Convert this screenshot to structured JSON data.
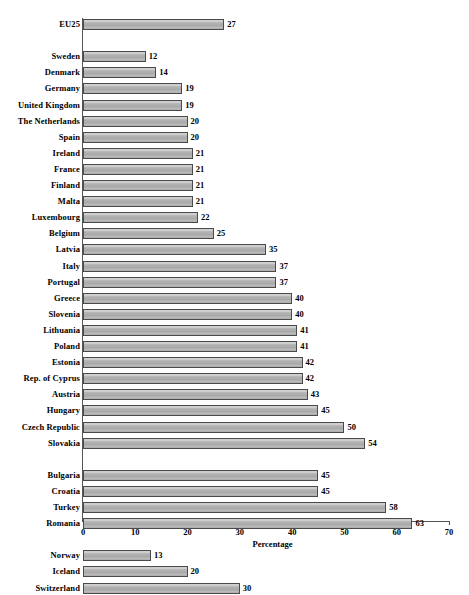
{
  "chart_data": {
    "type": "bar",
    "orientation": "horizontal",
    "title": "",
    "xlabel": "Percentage",
    "ylabel": "",
    "xlim": [
      0,
      70
    ],
    "xticks": [
      0,
      10,
      20,
      30,
      40,
      50,
      60,
      70
    ],
    "grid": false,
    "legend": null,
    "bar_value_labels": true,
    "groups": [
      {
        "name": "aggregate",
        "categories": [
          "EU25"
        ],
        "values": [
          27
        ]
      },
      {
        "name": "eu-member-states",
        "categories": [
          "Sweden",
          "Denmark",
          "Germany",
          "United Kingdom",
          "The Netherlands",
          "Spain",
          "Ireland",
          "France",
          "Finland",
          "Malta",
          "Luxembourg",
          "Belgium",
          "Latvia",
          "Italy",
          "Portugal",
          "Greece",
          "Slovenia",
          "Lithuania",
          "Poland",
          "Estonia",
          "Rep. of Cyprus",
          "Austria",
          "Hungary",
          "Czech Republic",
          "Slovakia"
        ],
        "values": [
          12,
          14,
          19,
          19,
          20,
          20,
          21,
          21,
          21,
          21,
          22,
          25,
          35,
          37,
          37,
          40,
          40,
          41,
          41,
          42,
          42,
          43,
          45,
          50,
          54
        ]
      },
      {
        "name": "candidate-countries",
        "categories": [
          "Bulgaria",
          "Croatia",
          "Turkey",
          "Romania"
        ],
        "values": [
          45,
          45,
          58,
          63
        ]
      },
      {
        "name": "efta-countries",
        "categories": [
          "Norway",
          "Iceland",
          "Switzerland"
        ],
        "values": [
          13,
          20,
          30
        ]
      }
    ],
    "categories": [
      "EU25",
      "Sweden",
      "Denmark",
      "Germany",
      "United Kingdom",
      "The Netherlands",
      "Spain",
      "Ireland",
      "France",
      "Finland",
      "Malta",
      "Luxembourg",
      "Belgium",
      "Latvia",
      "Italy",
      "Portugal",
      "Greece",
      "Slovenia",
      "Lithuania",
      "Poland",
      "Estonia",
      "Rep. of Cyprus",
      "Austria",
      "Hungary",
      "Czech Republic",
      "Slovakia",
      "Bulgaria",
      "Croatia",
      "Turkey",
      "Romania",
      "Norway",
      "Iceland",
      "Switzerland"
    ],
    "values": [
      27,
      12,
      14,
      19,
      19,
      20,
      20,
      21,
      21,
      21,
      21,
      22,
      25,
      35,
      37,
      37,
      40,
      40,
      41,
      41,
      42,
      42,
      43,
      45,
      50,
      54,
      45,
      45,
      58,
      63,
      13,
      20,
      30
    ]
  },
  "style": {
    "bar_fill": "#b0b0b0",
    "bar_border": "#4a4a4a",
    "axis_color": "#555555",
    "text_color": "#000000",
    "background": "#ffffff"
  }
}
